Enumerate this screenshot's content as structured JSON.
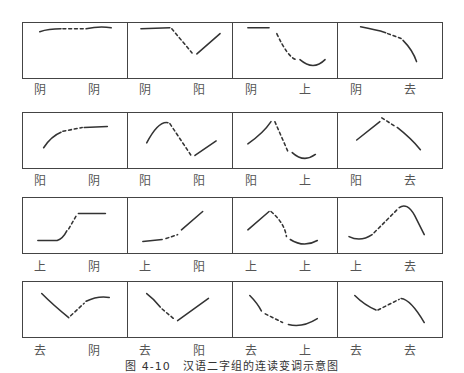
{
  "caption": "图 4-10　汉语二字组的连读变调示意图",
  "rows": [
    {
      "cells": [
        {
          "first": "阴",
          "second": "阴"
        },
        {
          "first": "阴",
          "second": "阳"
        },
        {
          "first": "阴",
          "second": "上"
        },
        {
          "first": "阴",
          "second": "去"
        }
      ]
    },
    {
      "cells": [
        {
          "first": "阳",
          "second": "阴"
        },
        {
          "first": "阳",
          "second": "阳"
        },
        {
          "first": "阳",
          "second": "上"
        },
        {
          "first": "阳",
          "second": "去"
        }
      ]
    },
    {
      "cells": [
        {
          "first": "上",
          "second": "阴"
        },
        {
          "first": "上",
          "second": "阳"
        },
        {
          "first": "上",
          "second": "上"
        },
        {
          "first": "上",
          "second": "去"
        }
      ]
    },
    {
      "cells": [
        {
          "first": "去",
          "second": "阴"
        },
        {
          "first": "去",
          "second": "阳"
        },
        {
          "first": "去",
          "second": "上"
        },
        {
          "first": "去",
          "second": "去"
        }
      ]
    }
  ]
}
